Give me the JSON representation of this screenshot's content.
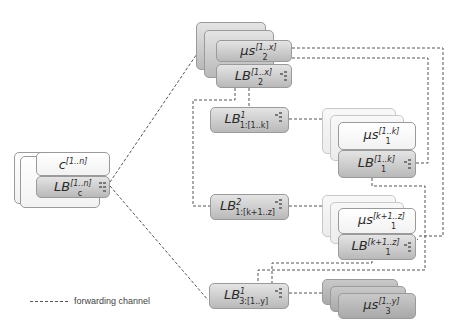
{
  "diagram": {
    "type": "load-balancer-hierarchy",
    "nodes": {
      "client": {
        "main": "c",
        "sup": "[1..n]",
        "sub": ""
      },
      "client_lb": {
        "main": "LB",
        "sup": "[1..n]",
        "sub": "c"
      },
      "ms2": {
        "main": "μs",
        "sup": "[1..x]",
        "sub": "2"
      },
      "lb2": {
        "main": "LB",
        "sup": "[1..x]",
        "sub": "2"
      },
      "lb1_1": {
        "main": "LB",
        "sup": "1",
        "sub": "1:[1..k]"
      },
      "ms1_a": {
        "main": "μs",
        "sup": "[1..k]",
        "sub": "1"
      },
      "lb1_a": {
        "main": "LB",
        "sup": "[1..k]",
        "sub": "1"
      },
      "lb1_2": {
        "main": "LB",
        "sup": "2",
        "sub": "1:[k+1..z]"
      },
      "ms1_b": {
        "main": "μs",
        "sup": "[k+1..z]",
        "sub": "1"
      },
      "lb1_b": {
        "main": "LB",
        "sup": "[k+1..z]",
        "sub": "1"
      },
      "lb3_1": {
        "main": "LB",
        "sup": "1",
        "sub": "3:[1..y]"
      },
      "ms3": {
        "main": "μs",
        "sup": "[1..y]",
        "sub": "3"
      }
    },
    "edges": [
      [
        "client_lb",
        "lb2"
      ],
      [
        "client_lb",
        "lb3_1"
      ],
      [
        "lb2",
        "lb1_1"
      ],
      [
        "lb2",
        "lb1_2"
      ],
      [
        "lb1_1",
        "ms1_a"
      ],
      [
        "lb1_2",
        "ms1_b"
      ],
      [
        "lb1_a",
        "lb2"
      ],
      [
        "lb1_b",
        "lb2"
      ],
      [
        "lb1_a",
        "lb3_1"
      ],
      [
        "lb1_b",
        "lb3_1"
      ],
      [
        "lb3_1",
        "ms3"
      ]
    ]
  },
  "legend": {
    "forwarding_label": "forwarding channel"
  }
}
